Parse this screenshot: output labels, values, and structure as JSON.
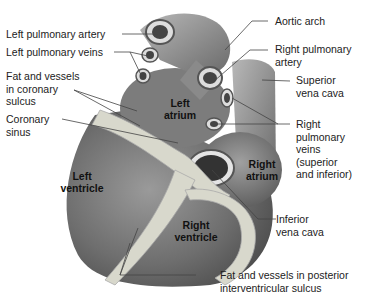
{
  "diagram": {
    "external_labels": [
      {
        "id": "left-pulmonary-artery",
        "text": "Left pulmonary artery"
      },
      {
        "id": "left-pulmonary-veins",
        "text": "Left pulmonary veins"
      },
      {
        "id": "fat-vessels-coronary-sulcus",
        "text": "Fat and vessels\nin coronary\nsulcus"
      },
      {
        "id": "coronary-sinus",
        "text": "Coronary\nsinus"
      },
      {
        "id": "aortic-arch",
        "text": "Aortic arch"
      },
      {
        "id": "right-pulmonary-artery",
        "text": "Right pulmonary\nartery"
      },
      {
        "id": "superior-vena-cava",
        "text": "Superior\nvena cava"
      },
      {
        "id": "right-pulmonary-veins",
        "text": "Right\npulmonary\nveins\n(superior\nand inferior)"
      },
      {
        "id": "inferior-vena-cava",
        "text": "Inferior\nvena cava"
      },
      {
        "id": "fat-vessels-posterior-interventricular-sulcus",
        "text": "Fat and vessels in posterior\ninterventricular sulcus"
      }
    ],
    "internal_labels": [
      {
        "id": "left-atrium",
        "text": "Left\natrium"
      },
      {
        "id": "left-ventricle",
        "text": "Left\nventricle"
      },
      {
        "id": "right-atrium",
        "text": "Right\natrium"
      },
      {
        "id": "right-ventricle",
        "text": "Right\nventricle"
      }
    ],
    "colors": {
      "heart_dark": "#5a5a5a",
      "heart_mid": "#8a8a8a",
      "heart_light": "#c8c8c8",
      "fat": "#dcdcd2",
      "leader_line": "#444444",
      "text": "#222222"
    }
  }
}
